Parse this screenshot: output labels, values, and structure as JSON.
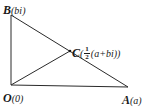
{
  "diagram": {
    "type": "geometry-complex-plane",
    "stroke_color": "#2a2a2a",
    "points": {
      "B": {
        "name": "B",
        "coord_text": "bi",
        "x": 11,
        "y": 15
      },
      "O": {
        "name": "O",
        "coord_text": "0",
        "x": 11,
        "y": 85
      },
      "A": {
        "name": "A",
        "coord_text": "a",
        "x": 128,
        "y": 87
      },
      "C": {
        "name": "C",
        "coord_prefix": "",
        "frac_num": "1",
        "frac_den": "2",
        "coord_suffix": "(a+bi)",
        "x": 70,
        "y": 51
      }
    },
    "segments": [
      {
        "from": "O",
        "to": "B"
      },
      {
        "from": "O",
        "to": "A"
      },
      {
        "from": "B",
        "to": "A"
      },
      {
        "from": "O",
        "to": "C"
      }
    ],
    "labels": {
      "B": {
        "point": "B",
        "open": "(",
        "close": ")"
      },
      "O": {
        "point": "O",
        "open": "(",
        "close": ")"
      },
      "A": {
        "point": "A",
        "open": "(",
        "close": ")"
      },
      "C": {
        "point": "C",
        "open": "(",
        "close": ")"
      }
    }
  }
}
